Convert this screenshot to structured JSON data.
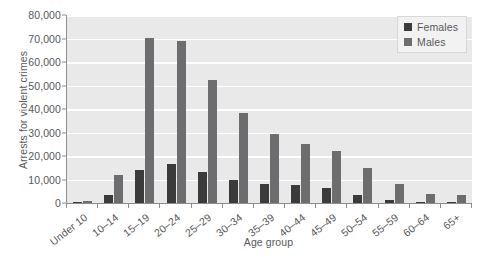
{
  "chart_data": {
    "type": "bar",
    "title": "",
    "xlabel": "Age group",
    "ylabel": "Arrests for violent crimes",
    "ylim": [
      0,
      80000
    ],
    "ytick_values": [
      0,
      10000,
      20000,
      30000,
      40000,
      50000,
      60000,
      70000,
      80000
    ],
    "ytick_labels": [
      "0",
      "10,000",
      "20,000",
      "30,000",
      "40,000",
      "50,000",
      "60,000",
      "70,000",
      "80,000"
    ],
    "grid": true,
    "legend_position": "top-right",
    "categories": [
      "Under 10",
      "10–14",
      "15–19",
      "20–24",
      "25–29",
      "30–34",
      "35–39",
      "40–44",
      "45–49",
      "50–54",
      "55–59",
      "60–64",
      "65+"
    ],
    "series": [
      {
        "name": "Females",
        "color": "#3b3b3c",
        "values": [
          500,
          3200,
          14000,
          16500,
          13000,
          10000,
          8200,
          7500,
          6200,
          3300,
          1300,
          600,
          400
        ]
      },
      {
        "name": "Males",
        "color": "#6d6d6f",
        "values": [
          900,
          12000,
          70300,
          68800,
          52400,
          38200,
          29200,
          25000,
          22200,
          15000,
          8000,
          4000,
          3300
        ]
      }
    ]
  },
  "colors": {
    "females": "#3b3b3c",
    "males": "#6d6d6f",
    "plot_background": "#e9e9e9",
    "gridline": "#ffffff",
    "axis": "#8d8d8f",
    "text": "#58585a",
    "legend_background": "#f2f2f2"
  }
}
